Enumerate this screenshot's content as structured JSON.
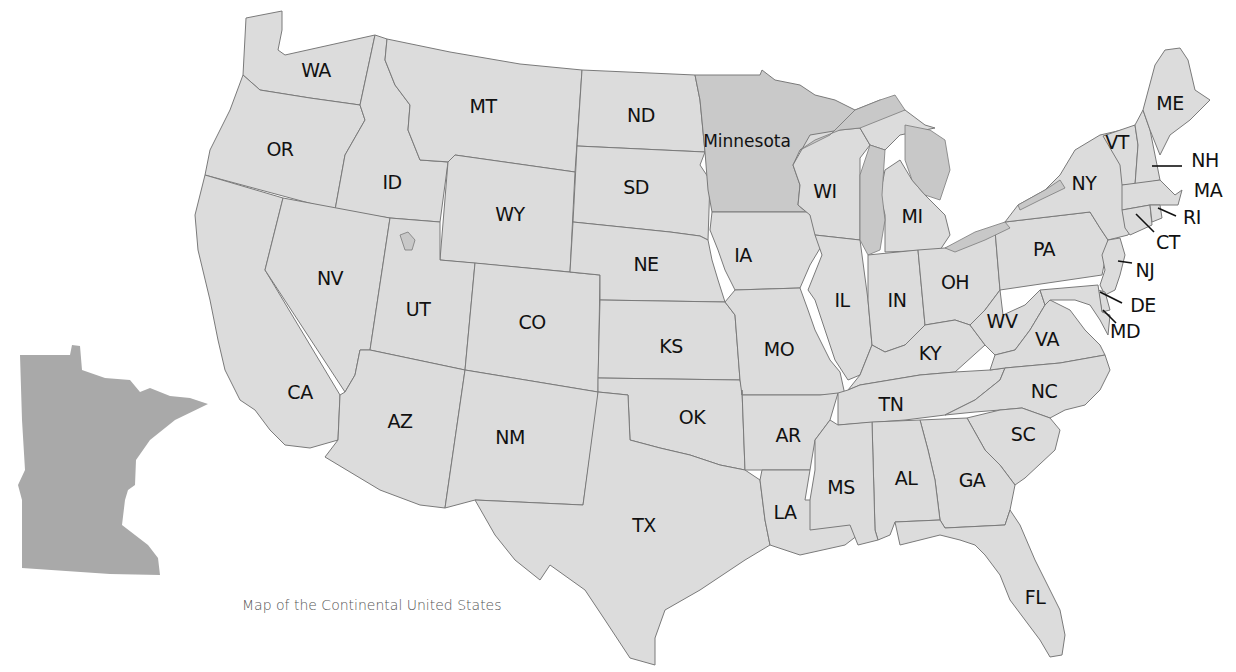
{
  "map": {
    "title": "Map of the Continental United States",
    "highlighted_state": "Minnesota",
    "colors": {
      "state_fill": "#dcdcdc",
      "highlight_fill": "#c9c9c9",
      "inset_fill": "#a9a9a9",
      "border": "#7a7a7a",
      "label": "#111111",
      "background": "#ffffff"
    },
    "inset": {
      "name": "Minnesota",
      "label_shown": false
    },
    "labels": {
      "WA": "WA",
      "OR": "OR",
      "CA": "CA",
      "ID": "ID",
      "NV": "NV",
      "MT": "MT",
      "WY": "WY",
      "UT": "UT",
      "AZ": "AZ",
      "CO": "CO",
      "NM": "NM",
      "ND": "ND",
      "SD": "SD",
      "NE": "NE",
      "KS": "KS",
      "OK": "OK",
      "TX": "TX",
      "MN": "Minnesota",
      "IA": "IA",
      "MO": "MO",
      "AR": "AR",
      "LA": "LA",
      "WI": "WI",
      "IL": "IL",
      "MS": "MS",
      "MI": "MI",
      "IN": "IN",
      "KY": "KY",
      "TN": "TN",
      "AL": "AL",
      "OH": "OH",
      "WV": "WV",
      "VA": "VA",
      "NC": "NC",
      "SC": "SC",
      "GA": "GA",
      "FL": "FL",
      "PA": "PA",
      "NY": "NY",
      "VT": "VT",
      "NH": "NH",
      "ME": "ME",
      "MA": "MA",
      "RI": "RI",
      "CT": "CT",
      "NJ": "NJ",
      "DE": "DE",
      "MD": "MD"
    }
  }
}
